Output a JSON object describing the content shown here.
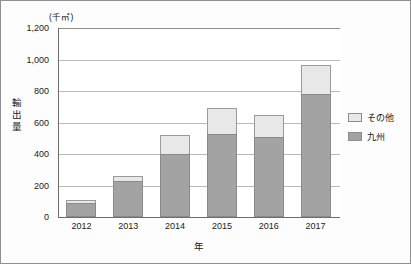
{
  "chart_data": {
    "type": "bar",
    "subtype": "stacked-vertical-bar",
    "title": "",
    "unit_label": "(千㎡)",
    "xlabel": "年",
    "ylabel": "輸出量",
    "categories": [
      "2012",
      "2013",
      "2014",
      "2015",
      "2016",
      "2017"
    ],
    "series": [
      {
        "name": "九州",
        "color": "#a3a3a3",
        "values": [
          90,
          230,
          400,
          530,
          510,
          780
        ]
      },
      {
        "name": "その他",
        "color": "#e8e8e8",
        "values": [
          20,
          30,
          120,
          160,
          140,
          185
        ]
      }
    ],
    "totals": [
      110,
      260,
      520,
      690,
      650,
      965
    ],
    "ylim": [
      0,
      1200
    ],
    "ytick_values": [
      1200,
      1000,
      800,
      600,
      400,
      200,
      0
    ],
    "ytick_labels": [
      "1,200",
      "1,000",
      "800",
      "600",
      "400",
      "200",
      "0"
    ],
    "grid": true,
    "legend_position": "right",
    "legend_entries": [
      "その他",
      "九州"
    ]
  },
  "legend": {
    "items": [
      {
        "label": "その他",
        "swatch_color": "#e8e8e8"
      },
      {
        "label": "九州",
        "swatch_color": "#a3a3a3"
      }
    ]
  },
  "axis": {
    "y_title_chars": [
      "輸",
      "出",
      "量"
    ]
  }
}
